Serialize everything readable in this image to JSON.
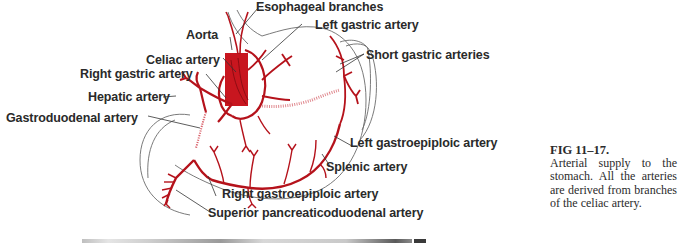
{
  "figure": {
    "labels": {
      "esophageal_branches": "Esophageal branches",
      "left_gastric_artery": "Left gastric artery",
      "aorta": "Aorta",
      "short_gastric_arteries": "Short gastric arteries",
      "celiac_artery": "Celiac artery",
      "right_gastric_artery": "Right gastric artery",
      "hepatic_artery": "Hepatic artery",
      "gastroduodenal_artery": "Gastroduodenal artery",
      "left_gastroepiploic_artery": "Left gastroepiploic artery",
      "splenic_artery": "Splenic artery",
      "right_gastroepiploic_artery": "Right gastroepiploic artery",
      "superior_pancreaticoduodenal_artery": "Superior pancreaticoduodenal artery"
    },
    "caption": {
      "title": "FIG 11–17.",
      "body": "Arterial supply to the stomach. All the arteries are derived from branches of the celiac artery."
    },
    "colors": {
      "artery": "#b5121b",
      "aorta": "#c8161f",
      "outline": "#555555",
      "label_text": "#2a2a2a"
    }
  }
}
